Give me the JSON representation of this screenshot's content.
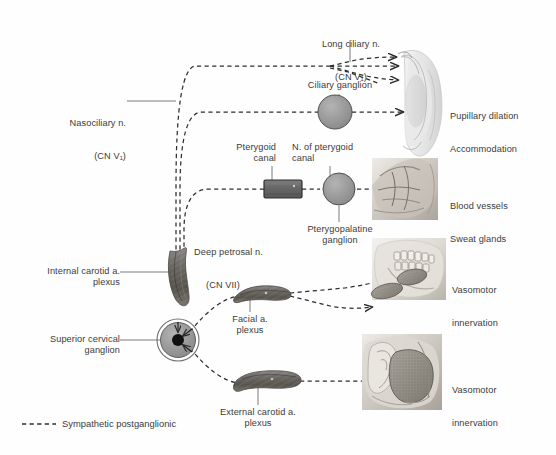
{
  "figure": {
    "background": "#fefefe",
    "ink": "#3b3b3b"
  },
  "legend": {
    "dash_label": "Sympathetic postganglionic",
    "dash_color": "#3b3b3b"
  },
  "labels": {
    "long_ciliary": "Long ciliary n.",
    "long_ciliary_cn": "(CN V₁)",
    "ciliary_ganglion": "Ciliary ganglion",
    "nasociliary": "Nasociliary n.",
    "nasociliary_cn": "(CN V₁)",
    "pterygoid_canal": "Pterygoid\ncanal",
    "n_of_pterygoid_canal": "N. of pterygoid\ncanal",
    "deep_petrosal": "Deep petrosal n.",
    "deep_petrosal_cn": "(CN VII)",
    "pterygopalatine_ganglion": "Pterygopalatine\nganglion",
    "internal_carotid": "Internal carotid a.\nplexus",
    "superior_cervical_ganglion": "Superior cervical\nganglion",
    "facial_plexus": "Facial a.\nplexus",
    "external_carotid": "External carotid a.\nplexus"
  },
  "targets": [
    {
      "name": "eye",
      "line1": "Pupillary dilation",
      "line2": "Accommodation"
    },
    {
      "name": "nasal-cavity",
      "line1": "Blood vessels",
      "line2": "Sweat glands"
    },
    {
      "name": "jaw-salivary",
      "line1": "Vasomotor",
      "line2": "innervation"
    },
    {
      "name": "ear-parotid",
      "line1": "Vasomotor",
      "line2": "innervation"
    }
  ],
  "structures": {
    "ciliary_ganglion": {
      "shape": "circle",
      "fill": "#9a9a9a",
      "stroke": "#555555"
    },
    "pterygopalatine_ganglion": {
      "shape": "circle",
      "fill": "#9a9a9a",
      "stroke": "#555555"
    },
    "superior_cervical_ganglion": {
      "shape": "circle-ring-dot",
      "fill": "#9a9a9a",
      "stroke": "#555555",
      "dot": "#111111"
    },
    "pterygoid_canal": {
      "shape": "rect",
      "fill": "#6b6b6b",
      "stroke": "#2e2e2e"
    },
    "internal_carotid_plexus": {
      "shape": "vessel",
      "fill": "#6d6a66"
    },
    "facial_plexus": {
      "shape": "vessel",
      "fill": "#6d6a66"
    },
    "external_carotid_plexus": {
      "shape": "vessel",
      "fill": "#6d6a66"
    }
  }
}
